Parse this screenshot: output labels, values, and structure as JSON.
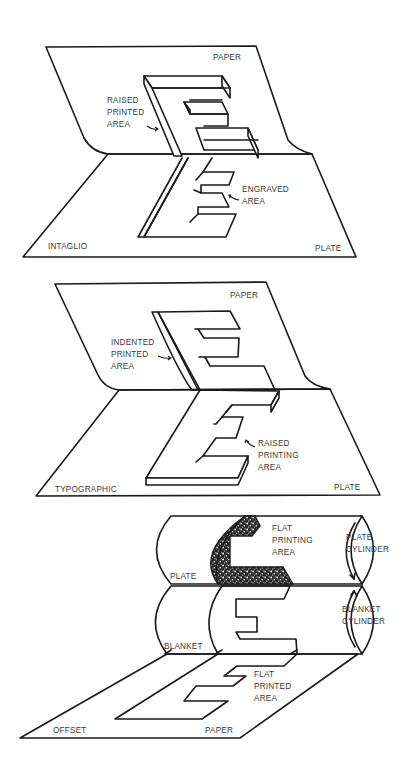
{
  "figure": {
    "panels": [
      {
        "id": "intaglio",
        "title": "INTAGLIO",
        "labels": {
          "paper": "PAPER",
          "plate": "PLATE",
          "raised": [
            "RAISED",
            "PRINTED",
            "AREA"
          ],
          "engraved": [
            "ENGRAVED",
            "AREA"
          ]
        }
      },
      {
        "id": "typographic",
        "title": "TYPOGRAPHIC",
        "labels": {
          "paper": "PAPER",
          "plate": "PLATE",
          "indented": [
            "INDENTED",
            "PRINTED",
            "AREA"
          ],
          "raised": [
            "RAISED",
            "PRINTING",
            "AREA"
          ]
        }
      },
      {
        "id": "offset",
        "title": "OFFSET",
        "labels": {
          "paper": "PAPER",
          "plate": "PLATE",
          "blanket": "BLANKET",
          "flat_printing": [
            "FLAT",
            "PRINTING",
            "AREA"
          ],
          "plate_cylinder": [
            "PLATE",
            "CYLINDER"
          ],
          "blanket_cylinder": [
            "BLANKET",
            "CYLINDER"
          ],
          "flat_printed": [
            "FLAT",
            "PRINTED",
            "AREA"
          ]
        }
      }
    ]
  }
}
